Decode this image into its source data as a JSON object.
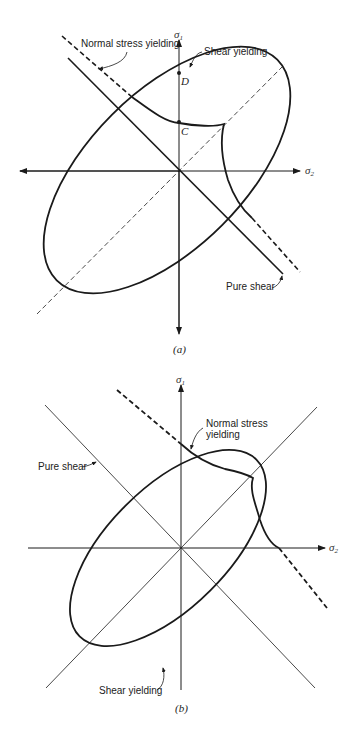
{
  "figure_a": {
    "caption": "(a)",
    "axes": {
      "x_label": "σ",
      "x_sub": "2",
      "y_label": "σ",
      "y_sub": "1"
    },
    "labels": {
      "normal_stress": "Normal stress yielding",
      "shear": "Shear yielding",
      "pure_shear": "Pure shear",
      "point_d": "D",
      "point_c": "C"
    }
  },
  "figure_b": {
    "caption": "(b)",
    "axes": {
      "x_label": "σ",
      "x_sub": "2",
      "y_label": "σ",
      "y_sub": "1"
    },
    "labels": {
      "normal_stress_line1": "Normal stress",
      "normal_stress_line2": "yielding",
      "pure_shear": "Pure shear",
      "shear": "Shear yielding"
    }
  },
  "colors": {
    "ink": "#1a1a1a",
    "background": "#ffffff"
  }
}
